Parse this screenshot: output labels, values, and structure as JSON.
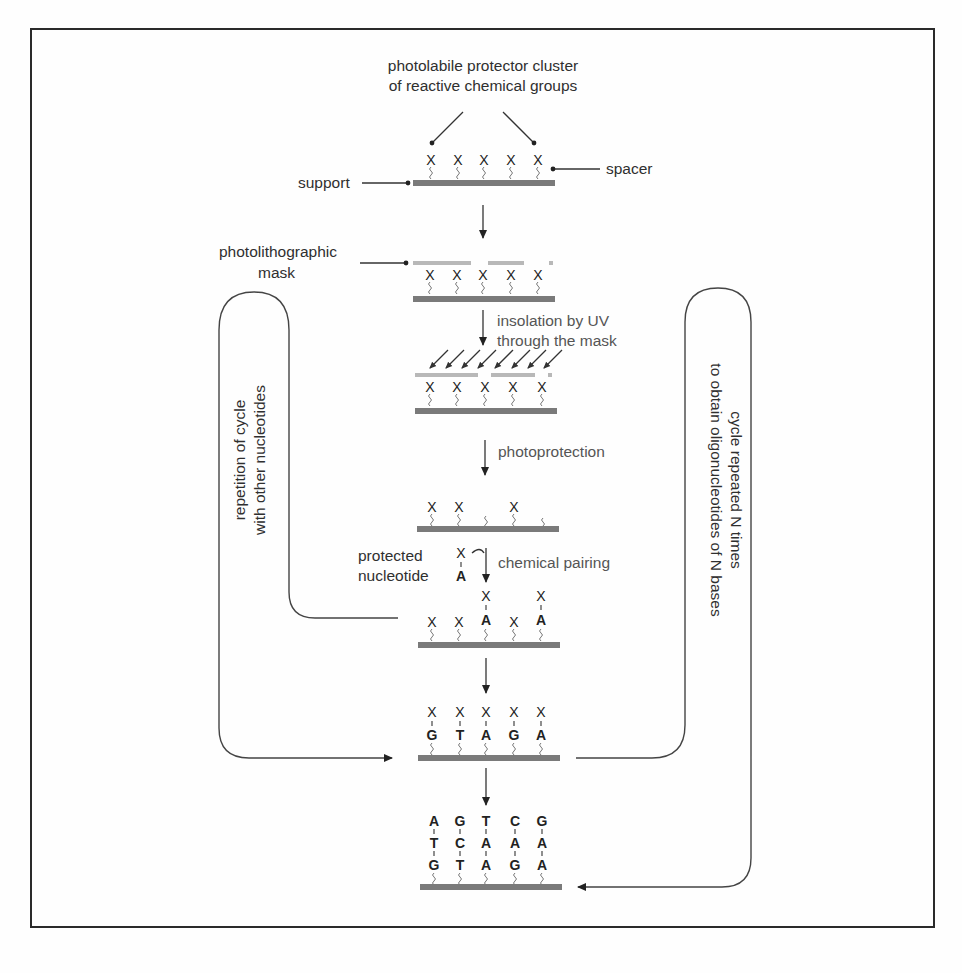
{
  "figure": {
    "title_line1": "photolabile protector cluster",
    "title_line2": "of reactive chemical groups",
    "labels": {
      "support": "support",
      "spacer": "spacer",
      "mask_line1": "photolithographic",
      "mask_line2": "mask",
      "insolation_line1": "insolation by UV",
      "insolation_line2": "through the mask",
      "photoprotection": "photoprotection",
      "protected_line1": "protected",
      "protected_line2": "nucleotide",
      "chemical_pairing": "chemical pairing",
      "left_loop_line1": "repetition of cycle",
      "left_loop_line2": "with other nucleotides",
      "right_loop_line1": "cycle repeated N times",
      "right_loop_line2": "to obtain oligonucleotides of N bases"
    },
    "protector_symbol": "X",
    "stages": [
      {
        "name": "initial",
        "columns": [
          [
            "X"
          ],
          [
            "X"
          ],
          [
            "X"
          ],
          [
            "X"
          ],
          [
            "X"
          ]
        ]
      },
      {
        "name": "masked",
        "columns": [
          [
            "X"
          ],
          [
            "X"
          ],
          [
            "X"
          ],
          [
            "X"
          ],
          [
            "X"
          ]
        ]
      },
      {
        "name": "insolation",
        "columns": [
          [
            "X"
          ],
          [
            "X"
          ],
          [
            "X"
          ],
          [
            "X"
          ],
          [
            "X"
          ]
        ]
      },
      {
        "name": "photoprotection",
        "columns": [
          [
            "X"
          ],
          [
            "X"
          ],
          [],
          [
            "X"
          ],
          []
        ]
      },
      {
        "name": "paired",
        "columns": [
          [
            "X"
          ],
          [
            "X"
          ],
          [
            "X",
            "A"
          ],
          [
            "X"
          ],
          [
            "X",
            "A"
          ]
        ]
      },
      {
        "name": "second-layer",
        "columns": [
          [
            "X",
            "G"
          ],
          [
            "X",
            "T"
          ],
          [
            "X",
            "A"
          ],
          [
            "X",
            "G"
          ],
          [
            "X",
            "A"
          ]
        ]
      },
      {
        "name": "final",
        "columns": [
          [
            "A",
            "T",
            "G"
          ],
          [
            "G",
            "C",
            "T"
          ],
          [
            "T",
            "A",
            "A"
          ],
          [
            "C",
            "A",
            "G"
          ],
          [
            "G",
            "A",
            "A"
          ]
        ]
      }
    ],
    "protected_nucleotide": [
      "X",
      "A"
    ]
  }
}
